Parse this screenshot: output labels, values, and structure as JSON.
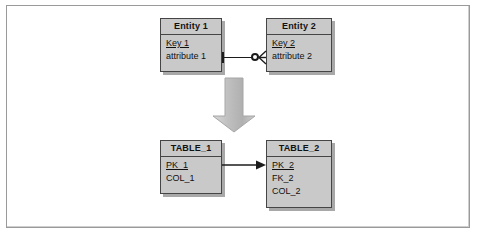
{
  "figure": {
    "background_color": "#ffffff",
    "frame_color": "#9a9a9a"
  },
  "palette": {
    "box_fill": "#c9c9c9",
    "box_border": "#454545",
    "box_shadow": "#a8a8a8",
    "line_color": "#1c1c1c",
    "arrow_fill": "#bdbdbd",
    "arrow_border": "#9b9b9b",
    "text_color": "#111111"
  },
  "er_model": {
    "entity1": {
      "header": "Entity 1",
      "attributes": [
        {
          "label": "Key 1",
          "is_key": true
        },
        {
          "label": "attribute 1",
          "is_key": false
        }
      ]
    },
    "entity2": {
      "header": "Entity 2",
      "attributes": [
        {
          "label": "Key 2",
          "is_key": true
        },
        {
          "label": "attribute 2",
          "is_key": false
        }
      ]
    },
    "relationship": {
      "left_cardinality": "one-mandatory-tick",
      "right_cardinality": "zero-or-many-crowsfoot"
    }
  },
  "transform_arrow": {
    "direction": "down",
    "semantic": "maps-to"
  },
  "relational_model": {
    "table1": {
      "header": "TABLE_1",
      "columns": [
        {
          "label": "PK_1",
          "is_key": true
        },
        {
          "label": "COL_1",
          "is_key": false
        }
      ]
    },
    "table2": {
      "header": "TABLE_2",
      "columns": [
        {
          "label": "PK_2",
          "is_key": true
        },
        {
          "label": "FK_2",
          "is_key": false
        },
        {
          "label": "COL_2",
          "is_key": false
        }
      ]
    },
    "foreign_key_link": {
      "from": "TABLE_1",
      "to": "TABLE_2",
      "direction": "right"
    }
  }
}
